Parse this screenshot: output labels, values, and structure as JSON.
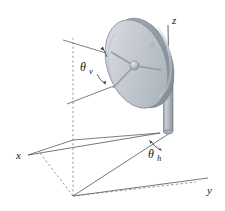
{
  "figure": {
    "name": "satellite-dish-antenna-orientation-diagram",
    "background_color": "#ffffff",
    "line_color": "#4a4f55",
    "text_color": "#15181c"
  },
  "axes": {
    "x": {
      "label": "x"
    },
    "y": {
      "label": "y"
    },
    "z": {
      "label": "z"
    }
  },
  "angles": {
    "vertical": {
      "symbol": "θ",
      "subscript": "v"
    },
    "horizontal": {
      "symbol": "θ",
      "subscript": "h"
    }
  },
  "dish": {
    "face_color": "#c3c8ce",
    "face_highlight": "#dfe3e7",
    "rim_color": "#8e97a2",
    "back_color": "#9aa3ad",
    "feed_color": "#aeb5bd"
  },
  "mount": {
    "post_color": "#b6bcc3",
    "post_shade": "#8d949c",
    "arm_color": "#b9bfc6"
  }
}
